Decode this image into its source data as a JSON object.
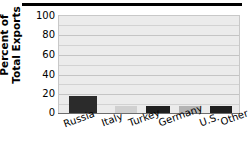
{
  "title": {
    "text": "",
    "note": "title-cropped-underline-only"
  },
  "axes": {
    "ylabel_line1": "Percent of",
    "ylabel_line2": "Total Exports",
    "yticks": [
      "100",
      "80",
      "60",
      "40",
      "20",
      "0"
    ],
    "xlabels": [
      "Russia",
      "Italy",
      "Turkey",
      "Germany",
      "U.S.",
      "Other"
    ]
  },
  "chart_data": {
    "type": "bar",
    "title": "",
    "xlabel": "",
    "ylabel": "Percent of Total Exports",
    "categories": [
      "Russia",
      "Italy",
      "Turkey",
      "Germany",
      "U.S.",
      "Other"
    ],
    "values": [
      18,
      7,
      7,
      7,
      7,
      60
    ],
    "ylim": [
      0,
      100
    ],
    "yticks": [
      0,
      20,
      40,
      60,
      80,
      100
    ],
    "minor_gridline_step": 10,
    "grid": true,
    "legend": "none",
    "bar_colors": [
      "#2b2b2b",
      "#d0d0d0",
      "#1f1f1f",
      "#b3b3b3",
      "#1f1f1f",
      "#7a7a7a"
    ],
    "plot_background": "#ebebeb"
  },
  "colors": {
    "plot_bg": "#ebebeb",
    "grid": "#d2d2d2",
    "axis": "#6d6d6d",
    "text": "#000000",
    "title_rule": "#000000"
  }
}
